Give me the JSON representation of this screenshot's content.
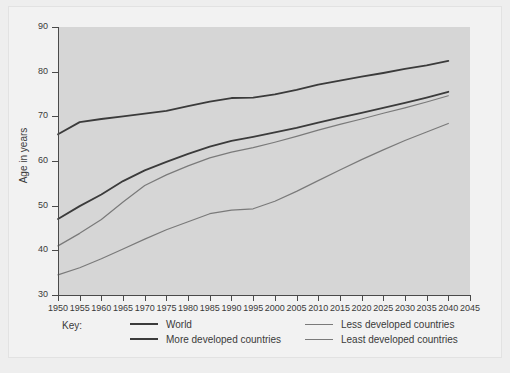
{
  "chart_data": {
    "type": "line",
    "title": "",
    "xlabel": "",
    "ylabel": "Age in years",
    "xlim": [
      1950,
      2045
    ],
    "ylim": [
      30,
      90
    ],
    "grid": false,
    "legend_position": "bottom",
    "legend_title": "Key:",
    "x_ticks": [
      1950,
      1955,
      1960,
      1965,
      1970,
      1975,
      1980,
      1985,
      1990,
      1995,
      2000,
      2005,
      2010,
      2015,
      2020,
      2025,
      2030,
      2035,
      2040,
      2045
    ],
    "y_ticks": [
      30,
      40,
      50,
      60,
      70,
      80,
      90
    ],
    "x": [
      1950,
      1955,
      1960,
      1965,
      1970,
      1975,
      1980,
      1985,
      1990,
      1995,
      2000,
      2005,
      2010,
      2015,
      2020,
      2025,
      2030,
      2035,
      2040
    ],
    "series": [
      {
        "name": "World",
        "color": "#3b3b3b",
        "width": 1.8,
        "values": [
          47.0,
          49.9,
          52.5,
          55.5,
          57.9,
          59.8,
          61.6,
          63.2,
          64.5,
          65.4,
          66.4,
          67.4,
          68.6,
          69.7,
          70.8,
          71.9,
          73.0,
          74.2,
          75.5
        ]
      },
      {
        "name": "More developed countries",
        "color": "#3b3b3b",
        "width": 1.8,
        "values": [
          66.0,
          68.7,
          69.4,
          70.0,
          70.6,
          71.2,
          72.3,
          73.3,
          74.1,
          74.2,
          74.9,
          75.9,
          77.1,
          78.0,
          78.9,
          79.7,
          80.6,
          81.4,
          82.4
        ]
      },
      {
        "name": "Less developed countries",
        "color": "#7a7a7a",
        "width": 1.2,
        "values": [
          41.0,
          43.8,
          46.9,
          50.8,
          54.5,
          56.9,
          58.9,
          60.7,
          62.0,
          63.0,
          64.2,
          65.5,
          66.9,
          68.2,
          69.4,
          70.7,
          71.9,
          73.2,
          74.6
        ]
      },
      {
        "name": "Least developed countries",
        "color": "#7a7a7a",
        "width": 1.2,
        "values": [
          34.5,
          36.1,
          38.1,
          40.3,
          42.5,
          44.6,
          46.4,
          48.2,
          49.0,
          49.3,
          51.0,
          53.2,
          55.6,
          58.0,
          60.3,
          62.5,
          64.6,
          66.5,
          68.4
        ]
      }
    ]
  }
}
